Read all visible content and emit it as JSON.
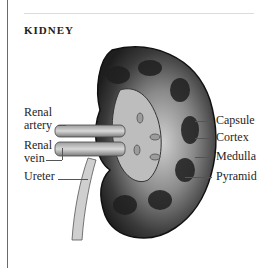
{
  "title": "KIDNEY",
  "labels_left": [
    {
      "id": "renal-artery",
      "lines": [
        "Renal",
        "artery"
      ]
    },
    {
      "id": "renal-vein",
      "lines": [
        "Renal",
        "vein"
      ]
    },
    {
      "id": "ureter",
      "lines": [
        "Ureter"
      ]
    }
  ],
  "labels_right": [
    {
      "id": "capsule",
      "text": "Capsule"
    },
    {
      "id": "cortex",
      "text": "Cortex"
    },
    {
      "id": "medulla",
      "text": "Medulla"
    },
    {
      "id": "pyramid",
      "text": "Pyramid"
    }
  ],
  "colors": {
    "ink": "#1e1e1e",
    "kidney_dark": "#2a2a2a",
    "kidney_mid": "#6e6e6e",
    "pelvis": "#b9b9b9"
  }
}
